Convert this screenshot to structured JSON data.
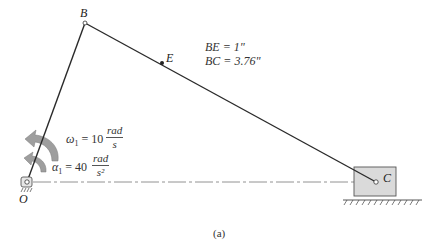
{
  "figure": {
    "caption": "(a)",
    "points": {
      "O": {
        "label": "O",
        "x": 27,
        "y": 182
      },
      "B": {
        "label": "B",
        "x": 85,
        "y": 23
      },
      "E": {
        "label": "E",
        "x": 162,
        "y": 63
      },
      "C": {
        "label": "C",
        "x": 376,
        "y": 182
      }
    },
    "dimensions": {
      "line1": "BE = 1\"",
      "line2": "BC = 3.76\""
    },
    "omega": {
      "symbol": "ω",
      "subscript": "1",
      "equals": "= 10",
      "num": "rad",
      "den": "s"
    },
    "alpha": {
      "symbol": "α",
      "subscript": "1",
      "equals": "= 40",
      "num": "rad",
      "den": "s²"
    },
    "colors": {
      "link": "#2a2a2a",
      "slider_fill": "#d9d9d9",
      "slider_stroke": "#555555",
      "arrow_fill": "#9e9e9e",
      "centerline": "#666666"
    }
  }
}
